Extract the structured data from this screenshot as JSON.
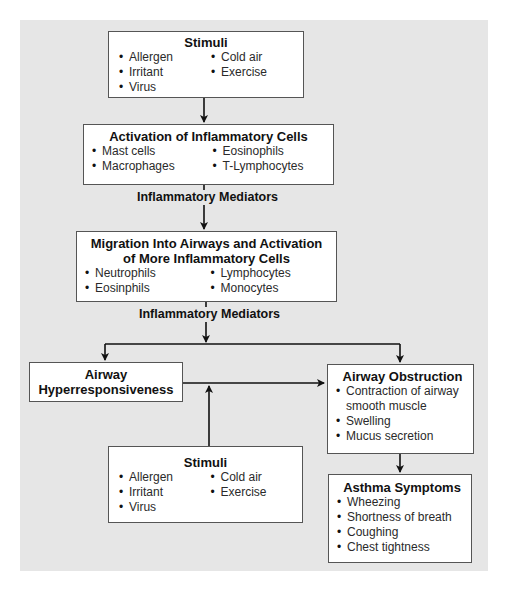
{
  "diagram": {
    "stimuli_top": {
      "title": "Stimuli",
      "col1": [
        "Allergen",
        "Irritant",
        "Virus"
      ],
      "col2": [
        "Cold air",
        "Exercise"
      ]
    },
    "activation": {
      "title": "Activation of Inflammatory Cells",
      "col1": [
        "Mast cells",
        "Macrophages"
      ],
      "col2": [
        "Eosinophils",
        "T-Lymphocytes"
      ]
    },
    "mediators_1": "Inflammatory Mediators",
    "migration": {
      "title_line1": "Migration Into Airways and Activation",
      "title_line2": "of More Inflammatory Cells",
      "col1": [
        "Neutrophils",
        "Eosinphils"
      ],
      "col2": [
        "Lymphocytes",
        "Monocytes"
      ]
    },
    "mediators_2": "Inflammatory Mediators",
    "hyperresponsiveness": {
      "title_line1": "Airway",
      "title_line2": "Hyperresponsiveness"
    },
    "obstruction": {
      "title": "Airway Obstruction",
      "items": [
        "Contraction of airway smooth muscle",
        "Swelling",
        "Mucus secretion"
      ]
    },
    "stimuli_bottom": {
      "title": "Stimuli",
      "col1": [
        "Allergen",
        "Irritant",
        "Virus"
      ],
      "col2": [
        "Cold air",
        "Exercise"
      ]
    },
    "symptoms": {
      "title": "Asthma Symptoms",
      "items": [
        "Wheezing",
        "Shortness of breath",
        "Coughing",
        "Chest tightness"
      ]
    }
  },
  "colors": {
    "panel_bg": "#e6e6e6",
    "box_bg": "#ffffff",
    "box_border": "#555555",
    "line": "#111111"
  }
}
